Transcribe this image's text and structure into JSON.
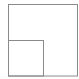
{
  "icon": {
    "name": "nested-squares-icon",
    "stroke_color": "#8a8a8a",
    "background": "#ffffff",
    "outer": {
      "x": 8,
      "y": 4.5,
      "w": 69,
      "h": 71.5
    },
    "inner": {
      "x": 8,
      "y": 40.5,
      "w": 35,
      "h": 35.5
    }
  }
}
